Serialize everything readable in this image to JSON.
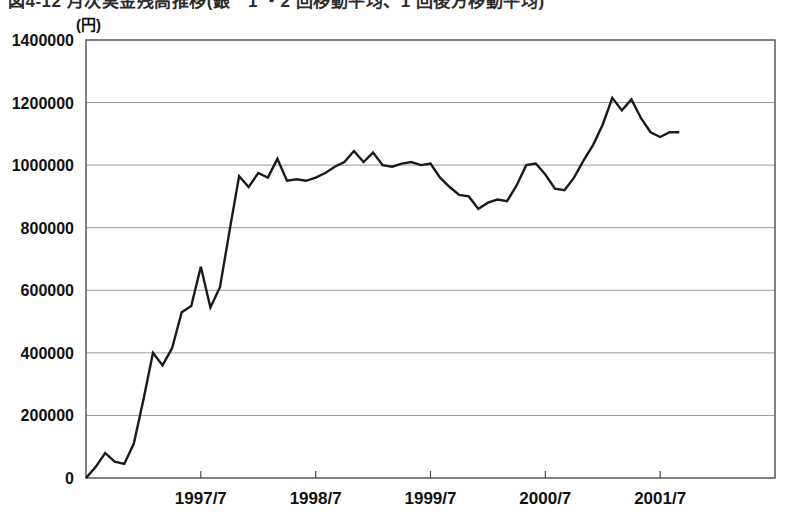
{
  "figure": {
    "title": "図4-12 月次実金残高推移(銀　1 ・2 回移動平均、1 回後方移動平均)",
    "unit_label": "(円)"
  },
  "chart_data": {
    "type": "line",
    "title": "図4-12 月次実金残高推移(銀　1 ・2 回移動平均、1 回後方移動平均)",
    "xlabel": "",
    "ylabel": "(円)",
    "ylim": [
      0,
      1400000
    ],
    "ytick_labels": [
      "0",
      "200000",
      "400000",
      "600000",
      "800000",
      "1000000",
      "1200000",
      "1400000"
    ],
    "ytick_values": [
      0,
      200000,
      400000,
      600000,
      800000,
      1000000,
      1200000,
      1400000
    ],
    "xtick_labels": [
      "1997/7",
      "1998/7",
      "1999/7",
      "2000/7",
      "2001/7"
    ],
    "xtick_values": [
      12,
      24,
      36,
      48,
      60
    ],
    "grid": true,
    "legend": null,
    "line_color": "#1a1a1a",
    "grid_color": "#9a9a9a",
    "frame_color": "#4a4a4a",
    "x_start_label": "1996/7",
    "x_index_range": [
      0,
      72
    ],
    "series": [
      {
        "name": "月次実金残高",
        "values": [
          0,
          35000,
          80000,
          52000,
          45000,
          110000,
          250000,
          400000,
          360000,
          415000,
          530000,
          550000,
          675000,
          545000,
          610000,
          790000,
          965000,
          930000,
          975000,
          960000,
          1020000,
          950000,
          955000,
          950000,
          960000,
          975000,
          995000,
          1010000,
          1045000,
          1010000,
          1040000,
          1000000,
          995000,
          1005000,
          1010000,
          1000000,
          1005000,
          960000,
          930000,
          905000,
          900000,
          860000,
          880000,
          890000,
          885000,
          935000,
          1000000,
          1005000,
          970000,
          925000,
          920000,
          960000,
          1015000,
          1065000,
          1130000,
          1215000,
          1175000,
          1210000,
          1150000,
          1105000,
          1090000,
          1105000,
          1105000
        ]
      }
    ]
  }
}
